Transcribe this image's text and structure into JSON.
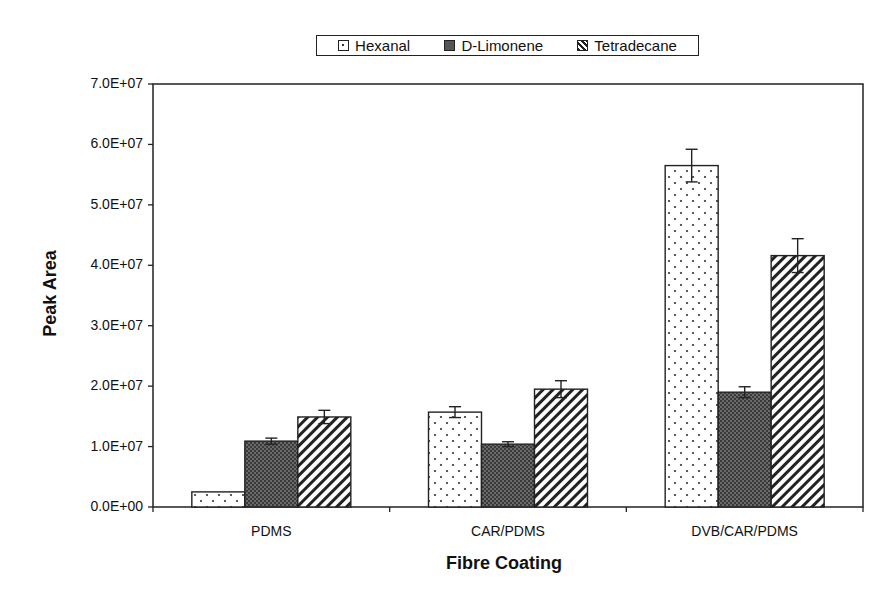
{
  "chart_data": {
    "type": "bar",
    "title": "",
    "xlabel": "Fibre Coating",
    "ylabel": "Peak Area",
    "ylim": [
      0,
      70000000
    ],
    "yticks": [
      0,
      10000000,
      20000000,
      30000000,
      40000000,
      50000000,
      60000000,
      70000000
    ],
    "ytick_labels": [
      "0.0E+00",
      "1.0E+07",
      "2.0E+07",
      "3.0E+07",
      "4.0E+07",
      "5.0E+07",
      "6.0E+07",
      "7.0E+07"
    ],
    "categories": [
      "PDMS",
      "CAR/PDMS",
      "DVB/CAR/PDMS"
    ],
    "series": [
      {
        "name": "Hexanal",
        "pattern": "dots",
        "values": [
          2500000,
          15700000,
          56500000
        ],
        "errors": [
          0,
          900000,
          2700000
        ]
      },
      {
        "name": "D-Limonene",
        "pattern": "dark-crosshatch",
        "values": [
          10900000,
          10400000,
          19000000
        ],
        "errors": [
          500000,
          400000,
          900000
        ]
      },
      {
        "name": "Tetradecane",
        "pattern": "diagonal-hatch",
        "values": [
          14900000,
          19500000,
          41600000
        ],
        "errors": [
          1100000,
          1400000,
          2800000
        ]
      }
    ],
    "grid": false,
    "legend_position": "top",
    "error_bars": true
  },
  "legend": {
    "items": [
      {
        "label": "Hexanal",
        "icon": "dotted-swatch"
      },
      {
        "label": "D-Limonene",
        "icon": "dark-crosshatch-swatch"
      },
      {
        "label": "Tetradecane",
        "icon": "diagonal-hatch-swatch"
      }
    ]
  },
  "axes": {
    "x_title": "Fibre Coating",
    "y_title": "Peak Area"
  }
}
